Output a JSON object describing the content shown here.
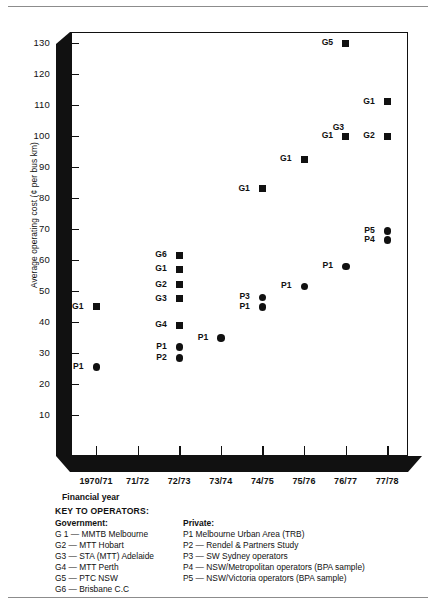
{
  "chart_data": {
    "type": "scatter",
    "title": "",
    "xlabel": "Financial year",
    "ylabel": "Average operating cost (¢ per bus km)",
    "categories": [
      "1970/71",
      "71/72",
      "72/73",
      "73/74",
      "74/75",
      "75/76",
      "76/77",
      "77/78"
    ],
    "ylim": [
      0,
      135
    ],
    "yticks": [
      10,
      20,
      30,
      40,
      50,
      60,
      70,
      80,
      90,
      100,
      110,
      120,
      130
    ],
    "grid": false,
    "legend_position": "below-plot",
    "series": [
      {
        "name": "Government",
        "marker": "square",
        "points": [
          {
            "label": "G1",
            "x": "1970/71",
            "y": 45
          },
          {
            "label": "G6",
            "x": "72/73",
            "y": 61.5
          },
          {
            "label": "G1",
            "x": "72/73",
            "y": 57
          },
          {
            "label": "G2",
            "x": "72/73",
            "y": 52
          },
          {
            "label": "G3",
            "x": "72/73",
            "y": 47.5
          },
          {
            "label": "G4",
            "x": "72/73",
            "y": 39
          },
          {
            "label": "G1",
            "x": "74/75",
            "y": 83
          },
          {
            "label": "G1",
            "x": "75/76",
            "y": 92.5
          },
          {
            "label": "G5",
            "x": "76/77",
            "y": 130
          },
          {
            "label": "G1",
            "x": "76/77",
            "y": 100
          },
          {
            "label": "G3",
            "x": "76/77",
            "y": 100,
            "label_above": true
          },
          {
            "label": "G2",
            "x": "77/78",
            "y": 100
          },
          {
            "label": "G1",
            "x": "77/78",
            "y": 111
          }
        ]
      },
      {
        "name": "Private",
        "marker": "circle",
        "points": [
          {
            "label": "P1",
            "x": "1970/71",
            "y": 25.5
          },
          {
            "label": "P1",
            "x": "72/73",
            "y": 32
          },
          {
            "label": "P2",
            "x": "72/73",
            "y": 28.5
          },
          {
            "label": "P1",
            "x": "73/74",
            "y": 35
          },
          {
            "label": "P3",
            "x": "74/75",
            "y": 48
          },
          {
            "label": "P1",
            "x": "74/75",
            "y": 45
          },
          {
            "label": "P1",
            "x": "75/76",
            "y": 51.5
          },
          {
            "label": "P1",
            "x": "76/77",
            "y": 58
          },
          {
            "label": "P5",
            "x": "77/78",
            "y": 69.5
          },
          {
            "label": "P4",
            "x": "77/78",
            "y": 66.5
          }
        ]
      }
    ]
  },
  "axis": {
    "ylabel": "Average operating cost (¢ per bus km)",
    "xlabel": "Financial year",
    "ytick_labels": [
      "130",
      "120",
      "110",
      "100",
      "90",
      "80",
      "70",
      "60",
      "50",
      "40",
      "30",
      "20",
      "10"
    ],
    "xtick_labels": [
      "1970/71",
      "71/72",
      "72/73",
      "73/74",
      "74/75",
      "75/76",
      "76/77",
      "77/78"
    ]
  },
  "key": {
    "title": "KEY TO OPERATORS:",
    "government_heading": "Government:",
    "private_heading": "Private:",
    "government": [
      "G 1 — MMTB Melbourne",
      "G2 — MTT Hobart",
      "G3 — STA (MTT) Adelaide",
      "G4 — MTT Perth",
      "G5 — PTC NSW",
      "G6 — Brisbane C.C"
    ],
    "private": [
      "P1    Melbourne Urban Area (TRB)",
      "P2 — Rendel & Partners Study",
      "P3 — SW Sydney operators",
      "P4 — NSW/Metropolitan operators (BPA sample)",
      "P5 — NSW/Victoria operators (BPA sample)"
    ]
  },
  "colors": {
    "ink": "#111111",
    "rule": "#8c8c8c",
    "background": "#ffffff"
  }
}
